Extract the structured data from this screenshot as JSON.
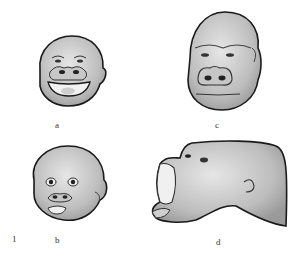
{
  "figure": {
    "number": "1",
    "panels": [
      {
        "id": "a",
        "label": "a",
        "subject": "young gorilla face, open-mouth smile"
      },
      {
        "id": "b",
        "label": "b",
        "subject": "infant gorilla face, lips pursed"
      },
      {
        "id": "c",
        "label": "c",
        "subject": "adult gorilla face, neutral"
      },
      {
        "id": "d",
        "label": "d",
        "subject": "gorilla head tilted back, mouth wide open"
      }
    ]
  },
  "colors": {
    "outline": "#1a1a1a",
    "skin_light": "#d9d9d9",
    "skin_mid": "#b8b8b8",
    "skin_dark": "#8c8c8c",
    "background": "#ffffff"
  }
}
